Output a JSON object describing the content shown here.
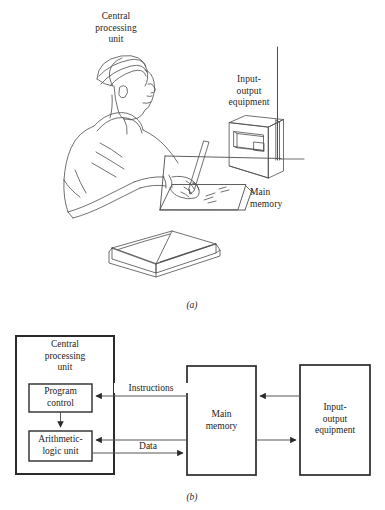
{
  "figure": {
    "panel_a": {
      "caption": "(a)",
      "labels": [
        {
          "id": "cpu",
          "text": "Central\nprocessing\nunit"
        },
        {
          "id": "io",
          "text": "Input-\noutput\nequipment"
        },
        {
          "id": "memory",
          "text": "Main\nmemory"
        }
      ],
      "scene_items": [
        "person-writing",
        "desk",
        "paper-sheet",
        "pencil",
        "open-book",
        "radio-receiver",
        "antenna"
      ]
    },
    "panel_b": {
      "caption": "(b)",
      "blocks": [
        {
          "id": "cpu",
          "label": "Central\nprocessing\nunit"
        },
        {
          "id": "program-control",
          "label": "Program\ncontrol"
        },
        {
          "id": "alu",
          "label": "Arithmetic-\nlogic unit"
        },
        {
          "id": "main-memory",
          "label": "Main\nmemory"
        },
        {
          "id": "io-equipment",
          "label": "Input-\noutput\nequipment"
        }
      ],
      "flows": [
        {
          "id": "instructions",
          "label": "Instructions",
          "from": "main-memory",
          "to": "program-control"
        },
        {
          "id": "data-in",
          "label": "",
          "from": "main-memory",
          "to": "alu"
        },
        {
          "id": "data-out",
          "label": "Data",
          "from": "alu",
          "to": "main-memory"
        },
        {
          "id": "io-to-memory",
          "label": "",
          "from": "io-equipment",
          "to": "main-memory"
        },
        {
          "id": "memory-to-io",
          "label": "",
          "from": "main-memory",
          "to": "io-equipment"
        },
        {
          "id": "control-to-alu",
          "label": "",
          "from": "program-control",
          "to": "alu"
        }
      ]
    }
  },
  "colors": {
    "ink": "#1d1d1d",
    "line": "#4a4a4a",
    "arrow": "#555555",
    "background": "#ffffff"
  }
}
